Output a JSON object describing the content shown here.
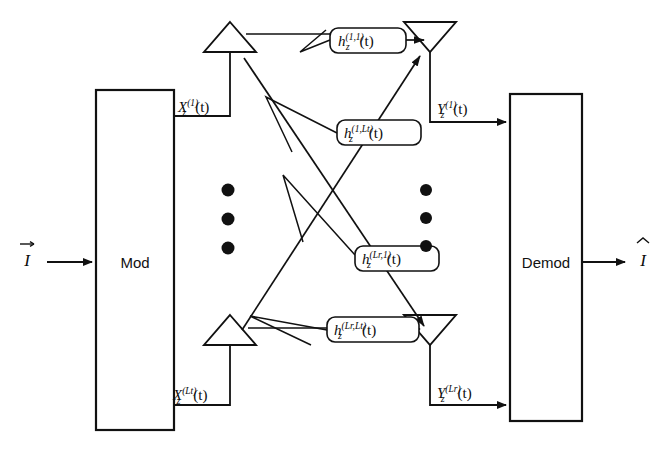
{
  "figure": {
    "type": "block-diagram",
    "background_color": "#ffffff",
    "line_color": "#111111",
    "dot_color": "#111111"
  },
  "blocks": {
    "modulator": {
      "label": "Mod",
      "x": 96,
      "y": 90,
      "width": 78,
      "height": 340
    },
    "demodulator": {
      "label": "Demod",
      "x": 510,
      "y": 94,
      "width": 72,
      "height": 327
    }
  },
  "io": {
    "input_symbol": "I",
    "input_accent": "vector-arrow",
    "output_symbol": "I",
    "output_accent": "hat"
  },
  "transmit_signals": [
    {
      "base": "X",
      "subscript": "z",
      "superscript": "(1)",
      "argument": "(t)",
      "text": "Xz(1)(t)"
    },
    {
      "base": "X",
      "subscript": "z",
      "superscript": "(Lt)",
      "argument": "(t)",
      "text": "Xz(Lt)(t)"
    }
  ],
  "receive_signals": [
    {
      "base": "Y",
      "subscript": "z",
      "superscript": "(1)",
      "argument": "(t)",
      "text": "Yz(1)(t)"
    },
    {
      "base": "Y",
      "subscript": "z",
      "superscript": "(Lr)",
      "argument": "(t)",
      "text": "Yz(Lr)(t)"
    }
  ],
  "channel_labels": [
    {
      "base": "h",
      "subscript": "z",
      "superscript": "(1,1)",
      "argument": "(t)",
      "x": 330,
      "y": 28,
      "width": 76,
      "height": 25
    },
    {
      "base": "h",
      "subscript": "z",
      "superscript": "(1,Lt)",
      "argument": "(t)",
      "x": 337,
      "y": 120,
      "width": 84,
      "height": 25
    },
    {
      "base": "h",
      "subscript": "z",
      "superscript": "(Lr,1)",
      "argument": "(t)",
      "x": 355,
      "y": 246,
      "width": 84,
      "height": 25
    },
    {
      "base": "h",
      "subscript": "z",
      "superscript": "(Lr,Lt)",
      "argument": "(t)",
      "x": 327,
      "y": 317,
      "width": 92,
      "height": 25
    }
  ],
  "antennas": {
    "transmit": [
      {
        "name": "tx-antenna-1",
        "x": 230,
        "base_y": 52,
        "apex_y": 22
      },
      {
        "name": "tx-antenna-lt",
        "x": 230,
        "base_y": 345,
        "apex_y": 315
      }
    ],
    "receive": [
      {
        "name": "rx-antenna-1",
        "x": 430,
        "top_y": 22,
        "apex_y": 52
      },
      {
        "name": "rx-antenna-lr",
        "x": 430,
        "top_y": 315,
        "apex_y": 345
      }
    ]
  },
  "ellipses": {
    "left_dots": {
      "x": 228,
      "ys": [
        190,
        219,
        248
      ],
      "count": 3
    },
    "right_dots": {
      "x": 426,
      "ys": [
        190,
        218,
        246
      ],
      "count": 3
    }
  }
}
